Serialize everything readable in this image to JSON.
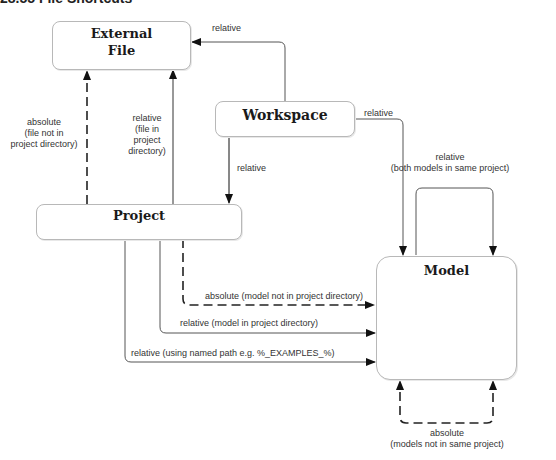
{
  "header": {
    "title": "28.55 File Shortcuts"
  },
  "nodes": {
    "external_file": {
      "label_line1": "External",
      "label_line2": "File"
    },
    "workspace": {
      "label": "Workspace"
    },
    "project": {
      "label": "Project"
    },
    "model": {
      "label": "Model"
    }
  },
  "edges": {
    "workspace_to_external": {
      "label": "relative",
      "style": "solid"
    },
    "workspace_to_model": {
      "label": "relative",
      "style": "solid"
    },
    "workspace_to_project": {
      "label": "relative",
      "style": "solid"
    },
    "project_to_external_absolute": {
      "line1": "absolute",
      "line2": "(file not in",
      "line3": "project directory)",
      "style": "dashed"
    },
    "project_to_external_relative": {
      "line1": "relative",
      "line2": "(file in",
      "line3": "project",
      "line4": "directory)",
      "style": "solid"
    },
    "model_self_relative": {
      "line1": "relative",
      "line2": "(both models in same project)",
      "style": "solid"
    },
    "project_to_model_absolute": {
      "label": "absolute (model not in project directory)",
      "style": "dashed"
    },
    "project_to_model_relative": {
      "label": "relative (model in project directory)",
      "style": "solid"
    },
    "project_to_model_named_path": {
      "label": "relative (using named path e.g. %_EXAMPLES_%)",
      "style": "solid"
    },
    "model_self_absolute": {
      "line1": "absolute",
      "line2": "(models not in same project)",
      "style": "dashed"
    }
  },
  "colors": {
    "line": "#555555",
    "dashed": "#222222",
    "box_border": "#b8b8b8",
    "text": "#333333"
  }
}
